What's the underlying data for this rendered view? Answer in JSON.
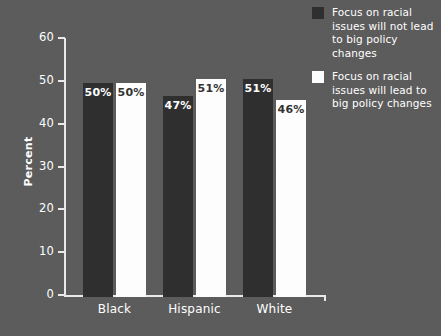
{
  "chart_data": {
    "type": "bar",
    "title": "",
    "xlabel": "",
    "ylabel": "Percent",
    "ylim": [
      0,
      60
    ],
    "yticks": [
      0,
      10,
      20,
      30,
      40,
      50,
      60
    ],
    "ytick_labels": [
      "0",
      "10",
      "20",
      "30",
      "40",
      "50",
      "60"
    ],
    "grid": false,
    "legend_position": "top-right",
    "categories": [
      "Black",
      "Hispanic",
      "White"
    ],
    "series": [
      {
        "name": "Focus on racial issues will not lead to big policy changes",
        "color": "#2f2f2f",
        "values": [
          50,
          47,
          51
        ],
        "value_labels": [
          "50%",
          "47%",
          "51%"
        ]
      },
      {
        "name": "Focus on racial issues will lead to big policy changes",
        "color": "#fdfdfd",
        "values": [
          50,
          51,
          46
        ],
        "value_labels": [
          "50%",
          "51%",
          "46%"
        ]
      }
    ]
  },
  "axis": {
    "y_title": "Percent",
    "y_tick_labels": [
      "60",
      "50",
      "40",
      "30",
      "20",
      "10",
      "0"
    ],
    "category_labels": [
      "Black",
      "Hispanic",
      "White"
    ]
  },
  "legend": {
    "items": [
      {
        "label": "Focus on racial issues will not lead to big policy changes",
        "swatch_color": "#2f2f2f"
      },
      {
        "label": "Focus on racial issues will lead to big policy changes",
        "swatch_color": "#fdfdfd"
      }
    ]
  },
  "colors": {
    "background": "#5b5b5b",
    "axis": "#e9e9e9",
    "text": "#ffffff",
    "series_dark": "#2f2f2f",
    "series_light": "#fdfdfd"
  }
}
